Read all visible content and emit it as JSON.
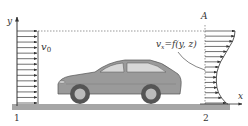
{
  "diagram": {
    "type": "flow-around-car",
    "labels": {
      "y_axis": "y",
      "x_axis": "x",
      "inlet_velocity": "v",
      "inlet_velocity_sub": "0",
      "section_A": "A",
      "outlet_velocity": "v",
      "outlet_velocity_sub": "x",
      "outlet_velocity_expr": "=f(y, z)",
      "station_1": "1",
      "station_2": "2"
    },
    "colors": {
      "ground": "#a6a6a6",
      "car_body": "#9a9a9a",
      "car_window": "#d8d8d8",
      "arrows": "#333333",
      "tire": "#555555"
    },
    "inlet_arrow_count": 14,
    "outlet_profile": [
      1.0,
      0.98,
      0.92,
      0.82,
      0.72,
      0.62,
      0.52,
      0.45,
      0.4,
      0.38,
      0.38,
      0.4,
      0.45,
      0.55,
      0.7
    ]
  }
}
